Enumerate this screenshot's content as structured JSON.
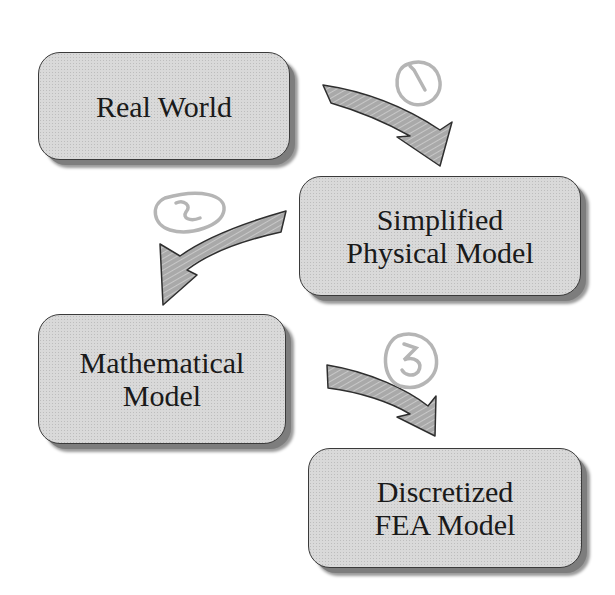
{
  "diagram": {
    "nodes": [
      {
        "id": "real-world",
        "lines": [
          "Real World"
        ]
      },
      {
        "id": "simplified-physical-model",
        "lines": [
          "Simplified",
          "Physical Model"
        ]
      },
      {
        "id": "mathematical-model",
        "lines": [
          "Mathematical",
          "Model"
        ]
      },
      {
        "id": "discretized-fea-model",
        "lines": [
          "Discretized",
          "FEA Model"
        ]
      }
    ],
    "edges": [
      {
        "from": "real-world",
        "to": "simplified-physical-model",
        "annotation": "1"
      },
      {
        "from": "simplified-physical-model",
        "to": "mathematical-model",
        "annotation": "2"
      },
      {
        "from": "mathematical-model",
        "to": "discretized-fea-model",
        "annotation": "3"
      }
    ],
    "colors": {
      "box_fill": "#d9d9d9",
      "box_border": "#3a3a3a",
      "shadow": "#7d7d7d",
      "arrow_fill": "#a8a8a8",
      "annotation": "#b5b5b5"
    }
  }
}
